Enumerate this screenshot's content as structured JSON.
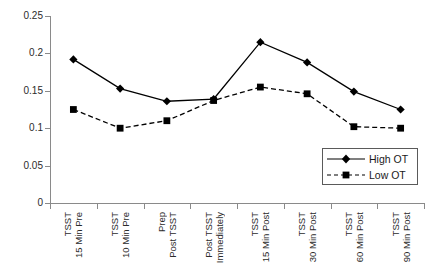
{
  "chart_data": {
    "type": "line",
    "title": "",
    "xlabel": "",
    "ylabel": "",
    "ylim": [
      0,
      0.25
    ],
    "yticks": [
      "0",
      "0.05",
      "0.1",
      "0.15",
      "0.2",
      "0.25"
    ],
    "ytick_values": [
      0,
      0.05,
      0.1,
      0.15,
      0.2,
      0.25
    ],
    "grid": false,
    "legend_position": "bottom-right",
    "categories": [
      "15 Min Pre TSST",
      "10 Min Pre TSST",
      "Post TSST Prep",
      "Immediately Post TSST",
      "15 Min Post TSST",
      "30 Min Post TSST",
      "60 Min Post TSST",
      "90 Min Post TSST"
    ],
    "category_lines": [
      [
        "15 Min Pre",
        "TSST"
      ],
      [
        "10 Min Pre",
        "TSST"
      ],
      [
        "Post TSST",
        "Prep"
      ],
      [
        "Immediately",
        "Post TSST"
      ],
      [
        "15 Min Post",
        "TSST"
      ],
      [
        "30 Min Post",
        "TSST"
      ],
      [
        "60 Min Post",
        "TSST"
      ],
      [
        "90 Min Post",
        "TSST"
      ]
    ],
    "series": [
      {
        "name": "High OT",
        "marker": "diamond",
        "linestyle": "solid",
        "color": "#000000",
        "values": [
          0.192,
          0.153,
          0.136,
          0.139,
          0.215,
          0.188,
          0.149,
          0.125
        ]
      },
      {
        "name": "Low OT",
        "marker": "square",
        "linestyle": "dashed",
        "color": "#000000",
        "values": [
          0.125,
          0.1,
          0.11,
          0.137,
          0.155,
          0.146,
          0.102,
          0.1
        ]
      }
    ]
  },
  "legend": {
    "entries": [
      {
        "label": "High OT"
      },
      {
        "label": "Low OT"
      }
    ]
  },
  "axis": {
    "line_color": "#8a8a8a"
  }
}
